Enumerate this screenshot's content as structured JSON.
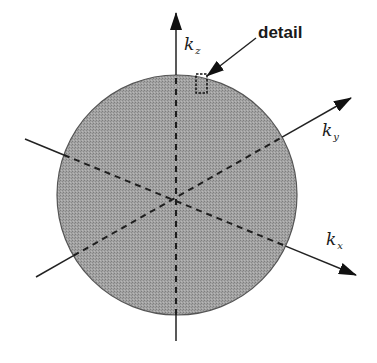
{
  "figure": {
    "sphere": {
      "cx": 177,
      "cy": 195,
      "r": 120,
      "fill": "#9c9c9c",
      "stroke": "#555555"
    },
    "axes": [
      {
        "id": "kz",
        "label_main": "k",
        "label_sub": "z",
        "x1": 176,
        "y1": 341,
        "x2": 176,
        "y2": 13,
        "label_x": 184,
        "label_y": 50
      },
      {
        "id": "ky",
        "label_main": "k",
        "label_sub": "y",
        "x1": 36,
        "y1": 277,
        "x2": 351,
        "y2": 98,
        "label_x": 322,
        "label_y": 136
      },
      {
        "id": "kx",
        "label_main": "k",
        "label_sub": "x",
        "x1": 25,
        "y1": 139,
        "x2": 356,
        "y2": 275,
        "label_x": 326,
        "label_y": 245
      }
    ],
    "detail": {
      "label": "detail",
      "label_x": 258,
      "label_y": 38,
      "box": {
        "x": 196,
        "y": 74,
        "w": 11,
        "h": 19
      },
      "arrow": {
        "x1": 256,
        "y1": 38,
        "x2": 207,
        "y2": 76
      }
    },
    "colors": {
      "line": "#222222",
      "dash": "#1e1e1e"
    }
  }
}
